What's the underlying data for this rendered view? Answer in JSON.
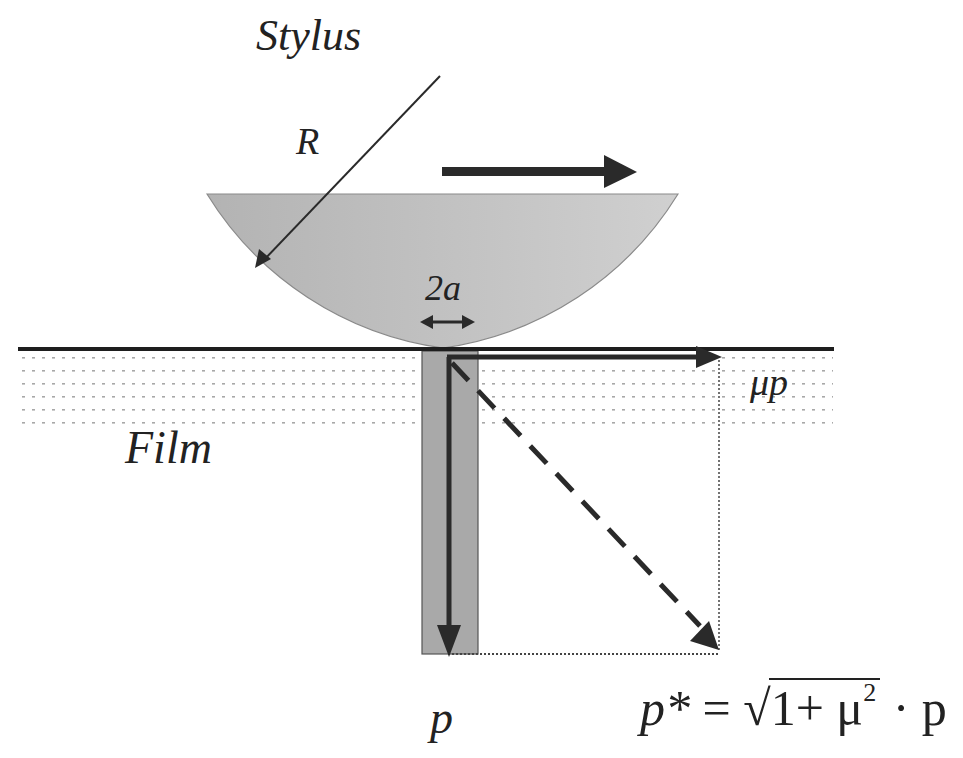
{
  "diagram": {
    "labels": {
      "stylus": "Stylus",
      "radius": "R",
      "contact_width": "2a",
      "film": "Film",
      "friction_force": "μp",
      "normal_force": "p"
    },
    "formula": {
      "lhs": "p*",
      "equals": "=",
      "radical_content": "1+ μ",
      "exponent": "2",
      "tail": "· p",
      "full_text": "p* = √(1+μ²) · p"
    },
    "colors": {
      "stylus_fill": "#b8b8b8",
      "column_fill": "#a9a9a9",
      "ink": "#2a2a2a",
      "film_dots": "#9a9a9a",
      "background": "#ffffff"
    }
  }
}
